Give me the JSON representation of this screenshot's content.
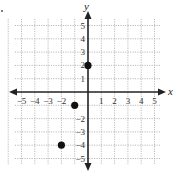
{
  "chart_data": {
    "type": "scatter",
    "title": "",
    "xlabel": "x",
    "ylabel": "y",
    "xlim": [
      -5,
      5
    ],
    "ylim": [
      -5,
      5
    ],
    "grid": true,
    "grid_style": "dotted",
    "x_ticks": [
      -5,
      -4,
      -3,
      -2,
      1,
      2,
      3,
      4,
      5
    ],
    "x_tick_labels": [
      "−5",
      "−4",
      "−3",
      "−2",
      "1",
      "2",
      "3",
      "4",
      "5"
    ],
    "y_ticks": [
      5,
      4,
      3,
      2,
      1,
      -2,
      -3,
      -4,
      -5
    ],
    "y_tick_labels": [
      "5",
      "4",
      "3",
      "2",
      "1",
      "−2",
      "−3",
      "−4",
      "−5"
    ],
    "series": [
      {
        "name": "points",
        "points": [
          {
            "x": 0,
            "y": 2
          },
          {
            "x": -1,
            "y": -1
          },
          {
            "x": -2,
            "y": -4
          }
        ]
      }
    ],
    "colors": {
      "axis": "#222222",
      "grid": "#aaaaaa",
      "point": "#111111"
    }
  },
  "axes": {
    "x_label": "x",
    "y_label": "y"
  }
}
